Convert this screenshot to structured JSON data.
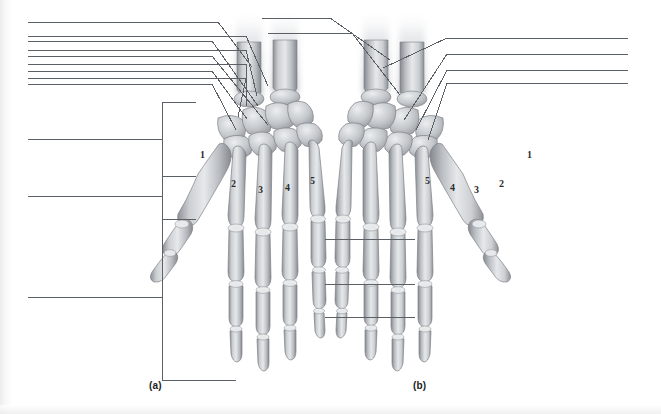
{
  "figure": {
    "width": 661,
    "height": 414,
    "background_color": "#ffffff",
    "line_color": "#5b5f66",
    "text_color": "#1c1c1c"
  },
  "captions": [
    {
      "id": "a",
      "label": "(a)",
      "x": 149,
      "y": 380,
      "view": "anterior / palmar view of left hand"
    },
    {
      "id": "b",
      "label": "(b)",
      "x": 413,
      "y": 380,
      "view": "posterior / dorsal view of right hand"
    }
  ],
  "digit_numbers": {
    "panel_a": [
      {
        "label": "1",
        "x": 200,
        "y": 155
      },
      {
        "label": "2",
        "x": 231,
        "y": 184
      },
      {
        "label": "3",
        "x": 258,
        "y": 190
      },
      {
        "label": "4",
        "x": 285,
        "y": 188
      },
      {
        "label": "5",
        "x": 310,
        "y": 181
      }
    ],
    "panel_b": [
      {
        "label": "5",
        "x": 425,
        "y": 181
      },
      {
        "label": "4",
        "x": 450,
        "y": 188
      },
      {
        "label": "3",
        "x": 474,
        "y": 190
      },
      {
        "label": "2",
        "x": 499,
        "y": 184
      },
      {
        "label": "1",
        "x": 527,
        "y": 155
      }
    ]
  },
  "leader_lines": {
    "left_group": [
      {
        "id": "L1",
        "blank_x1": 28,
        "blank_x2": 196,
        "blank_y": 41,
        "points": "196,41 212,41 258,106"
      },
      {
        "id": "L2",
        "blank_x1": 28,
        "blank_x2": 196,
        "blank_y": 56,
        "points": "196,56 212,56 268,125"
      },
      {
        "id": "L3",
        "blank_x1": 28,
        "blank_x2": 196,
        "blank_y": 71,
        "points": "196,71 212,71 247,119"
      },
      {
        "id": "L4",
        "blank_x1": 28,
        "blank_x2": 196,
        "blank_y": 84,
        "points": "196,84 212,84 236,130"
      },
      {
        "id": "L5",
        "blank_x1": 28,
        "blank_x2": 162,
        "blank_y": 139,
        "points": "162,139 162,139"
      },
      {
        "id": "L6",
        "blank_x1": 28,
        "blank_x2": 162,
        "blank_y": 196,
        "points": "162,196 162,196"
      },
      {
        "id": "L7",
        "blank_x1": 28,
        "blank_x2": 162,
        "blank_y": 297,
        "points": "162,297 162,297"
      }
    ],
    "left_brackets": [
      {
        "id": "B1",
        "x": 162,
        "y_top": 102,
        "y_bottom": 176,
        "tick_x2": 196,
        "stem_y": 139
      },
      {
        "id": "B2",
        "x": 162,
        "y_top": 176,
        "y_bottom": 219,
        "tick_x2": 196,
        "stem_y": 196
      },
      {
        "id": "B3",
        "x": 162,
        "y_top": 219,
        "y_bottom": 380,
        "tick_x2": 236,
        "stem_y": 297
      }
    ],
    "right_group": [
      {
        "id": "R1",
        "blank_x1": 462,
        "blank_x2": 628,
        "blank_y": 38,
        "points": "462,38 447,38 383,65"
      },
      {
        "id": "R2",
        "blank_x1": 462,
        "blank_x2": 628,
        "blank_y": 54,
        "points": "462,54 447,54 400,121"
      },
      {
        "id": "R3",
        "blank_x1": 462,
        "blank_x2": 628,
        "blank_y": 70,
        "points": "462,70 447,70 412,130"
      },
      {
        "id": "R4",
        "blank_x1": 462,
        "blank_x2": 628,
        "blank_y": 83,
        "points": "462,83 447,83 423,140"
      }
    ],
    "top_left_group": [
      {
        "id": "T1",
        "blank_x1": 202,
        "blank_x2": 386,
        "blank_y": 22,
        "points": "202,22 218,22 252,67"
      },
      {
        "id": "T2",
        "blank_x1": 232,
        "blank_x2": 386,
        "blank_y": 36,
        "points": "232,36 246,36 268,86"
      },
      {
        "id": "T3",
        "blank_x1": 232,
        "blank_x2": 386,
        "blank_y": 50,
        "points": "232,50 246,50 255,95"
      },
      {
        "id": "T4",
        "blank_x1": 232,
        "blank_x2": 386,
        "blank_y": 64,
        "points": "232,64 246,64 244,104"
      },
      {
        "id": "T5",
        "blank_x1": 232,
        "blank_x2": 386,
        "blank_y": 78,
        "points": "232,78 246,78 236,116"
      }
    ],
    "middle_group": [
      {
        "id": "M1",
        "blank_x1": 325,
        "blank_x2": 415,
        "blank_y": 239
      },
      {
        "id": "M2",
        "blank_x1": 325,
        "blank_x2": 415,
        "blank_y": 284
      },
      {
        "id": "M3",
        "blank_x1": 325,
        "blank_x2": 415,
        "blank_y": 317
      }
    ]
  }
}
